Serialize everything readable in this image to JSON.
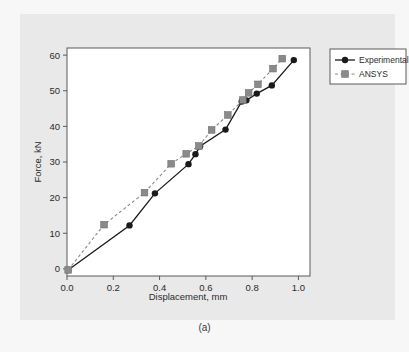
{
  "figure": {
    "caption": "(a)",
    "background_color": "#e9e9e9",
    "page_background_color": "#f7f7f7"
  },
  "chart_data": {
    "type": "line",
    "title": "",
    "xlabel": "Displacement, mm",
    "ylabel": "Force, kN",
    "xlim": [
      0.0,
      1.05
    ],
    "ylim": [
      -2,
      62
    ],
    "xticks": [
      "0.0",
      "0.2",
      "0.4",
      "0.6",
      "0.8",
      "1.0"
    ],
    "xtick_values": [
      0.0,
      0.2,
      0.4,
      0.6,
      0.8,
      1.0
    ],
    "yticks": [
      "0",
      "10",
      "20",
      "30",
      "40",
      "50",
      "60"
    ],
    "ytick_values": [
      0,
      10,
      20,
      30,
      40,
      50,
      60
    ],
    "grid": false,
    "legend_position": "outside right top",
    "series": [
      {
        "name": "Experimental",
        "color": "#1a1a1a",
        "line_style": "solid",
        "marker": "circle",
        "x": [
          0.005,
          0.27,
          0.38,
          0.525,
          0.555,
          0.575,
          0.685,
          0.755,
          0.775,
          0.82,
          0.885,
          0.98
        ],
        "y": [
          -0.3,
          12.2,
          21.2,
          29.4,
          32.2,
          34.4,
          39.1,
          47.0,
          47.3,
          49.2,
          51.5,
          58.6
        ]
      },
      {
        "name": "ANSYS",
        "color": "#8a8a8a",
        "line_style": "dashed",
        "marker": "square",
        "x": [
          0.005,
          0.16,
          0.335,
          0.45,
          0.515,
          0.57,
          0.625,
          0.695,
          0.76,
          0.785,
          0.825,
          0.89,
          0.93
        ],
        "y": [
          -0.3,
          12.4,
          21.4,
          29.5,
          32.3,
          34.5,
          39.0,
          43.2,
          47.4,
          49.4,
          51.8,
          56.2,
          59.0
        ]
      }
    ]
  },
  "legend": {
    "items": [
      {
        "label": "Experimental",
        "marker": "circle",
        "line_style": "solid",
        "color": "#1a1a1a"
      },
      {
        "label": "ANSYS",
        "marker": "square",
        "line_style": "dashed",
        "color": "#8a8a8a"
      }
    ]
  }
}
